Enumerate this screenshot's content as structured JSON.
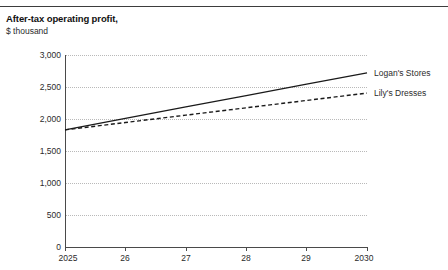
{
  "chart_data": {
    "type": "line",
    "title": "After-tax operating profit,",
    "subtitle": "$ thousand",
    "xlabel": "",
    "ylabel": "",
    "xlim": [
      2025,
      2030
    ],
    "ylim": [
      0,
      3000
    ],
    "grid": true,
    "legend_position": "right-of-plot-line-end",
    "x": [
      2025,
      2026,
      2027,
      2028,
      2029,
      2030
    ],
    "x_tick_labels": [
      "2025",
      "26",
      "27",
      "28",
      "29",
      "2030"
    ],
    "y_tick_labels": [
      "0",
      "500",
      "1,000",
      "1,500",
      "2,000",
      "2,500",
      "3,000"
    ],
    "y_tick_values": [
      0,
      500,
      1000,
      1500,
      2000,
      2500,
      3000
    ],
    "series": [
      {
        "name": "Logan's Stores",
        "style": "solid",
        "color": "#1a1a1a",
        "values": [
          1830,
          2010,
          2190,
          2365,
          2545,
          2720
        ]
      },
      {
        "name": "Lily's Dresses",
        "style": "dashed",
        "color": "#1a1a1a",
        "values": [
          1830,
          1945,
          2060,
          2175,
          2290,
          2405
        ]
      }
    ]
  }
}
